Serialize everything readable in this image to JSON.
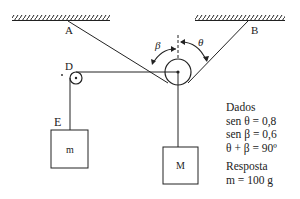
{
  "labels": {
    "A": "A",
    "B": "B",
    "D": "D",
    "E": "E",
    "beta": "β",
    "theta": "θ",
    "mass_small": "m",
    "mass_large": "M"
  },
  "given": {
    "heading": "Dados",
    "lines": [
      "sen θ =  0,8",
      "sen β = 0,6",
      "θ + β = 90º"
    ]
  },
  "answer": {
    "heading": "Resposta",
    "value": "m = 100 g"
  },
  "colors": {
    "ink": "#222222",
    "background": "#ffffff"
  }
}
